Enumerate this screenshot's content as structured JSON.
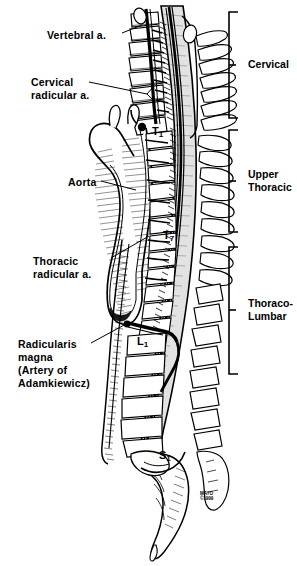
{
  "figure": {
    "credit_line1": "MAYO",
    "credit_line2": "©1999"
  },
  "annotations": [
    {
      "id": "vertebral-artery",
      "text": "Vertebral a.",
      "lines": [
        "Vertebral a."
      ],
      "x": 47,
      "y": 29
    },
    {
      "id": "cervical-radicular-artery",
      "text": "Cervical radicular a.",
      "lines": [
        "Cervical",
        "radicular a."
      ],
      "x": 31,
      "y": 76
    },
    {
      "id": "aorta",
      "text": "Aorta",
      "lines": [
        "Aorta"
      ],
      "x": 68,
      "y": 176
    },
    {
      "id": "thoracic-radicular-artery",
      "text": "Thoracic radicular a.",
      "lines": [
        "Thoracic",
        "radicular a."
      ],
      "x": 33,
      "y": 255
    },
    {
      "id": "radicularis-magna",
      "text": "Radicularis magna (Artery of Adamkiewicz)",
      "lines": [
        "Radicularis",
        "magna",
        "(Artery of",
        "Adamkiewicz)"
      ],
      "x": 18,
      "y": 338
    }
  ],
  "vertebral_levels": [
    {
      "id": "t1",
      "label": "T",
      "sub": "1",
      "x": 152,
      "y": 125
    },
    {
      "id": "t7",
      "label": "T",
      "sub": "7",
      "x": 163,
      "y": 229
    },
    {
      "id": "l1",
      "label": "L",
      "sub": "1",
      "x": 137,
      "y": 335
    },
    {
      "id": "s1",
      "label": "S",
      "sub": "1",
      "x": 159,
      "y": 449
    }
  ],
  "region_brackets": [
    {
      "id": "cervical",
      "lines": [
        "Cervical"
      ],
      "top": 12,
      "bottom": 118,
      "label_x": 248,
      "label_y": 58
    },
    {
      "id": "upper-thoracic",
      "lines": [
        "Upper",
        "Thoracic"
      ],
      "top": 130,
      "bottom": 232,
      "label_x": 248,
      "label_y": 168
    },
    {
      "id": "thoraco-lumbar",
      "lines": [
        "Thoraco-",
        "Lumbar"
      ],
      "top": 247,
      "bottom": 374,
      "label_x": 248,
      "label_y": 297
    }
  ],
  "colors": {
    "ink": "#000000",
    "background": "#ffffff",
    "shade_light": "#d8d8d8",
    "shade_mid": "#9a9a9a"
  }
}
